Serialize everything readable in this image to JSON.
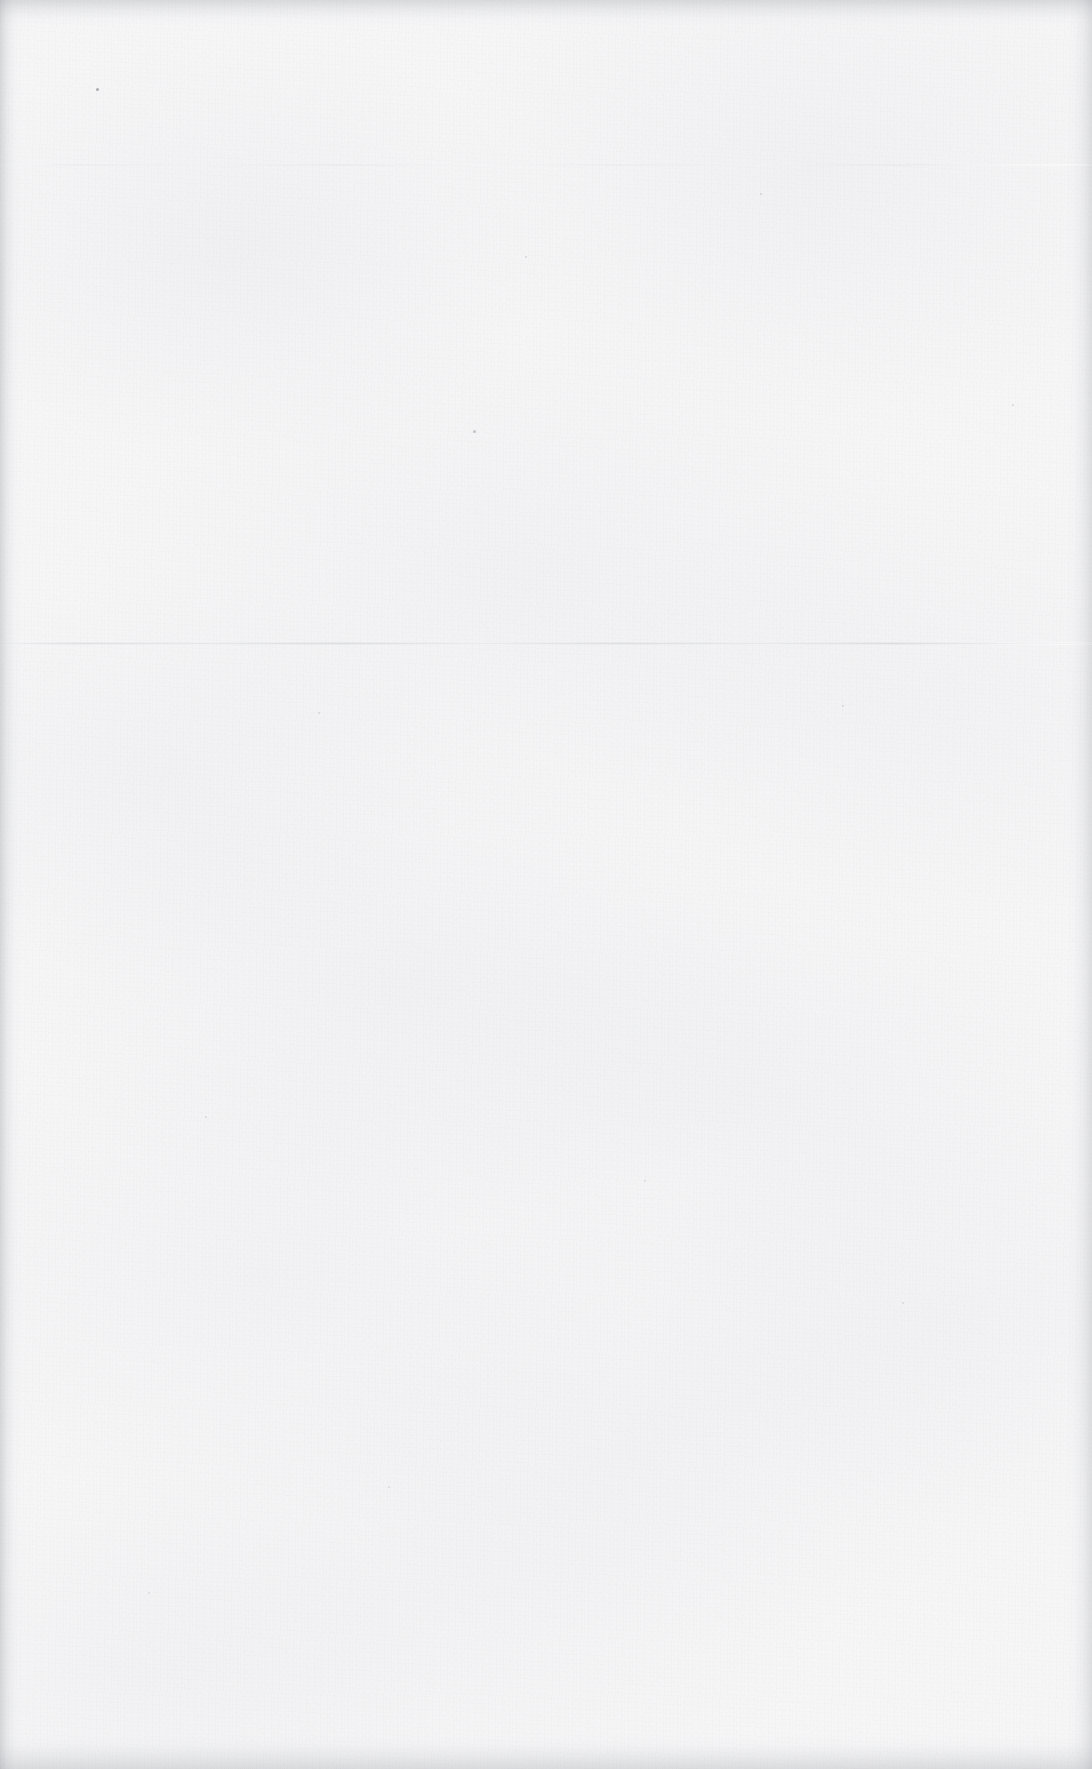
{
  "page": {
    "kind": "blank-scanned-page",
    "width": 1092,
    "height": 1769,
    "background_color": "#f6f6f7",
    "paper_tone_color": "#f7f7f8",
    "grain_color": "#a3a6ad",
    "has_text": false,
    "has_images": false,
    "has_tables": false
  },
  "artifacts": {
    "creases": [
      {
        "id": "primary-fold",
        "orientation": "horizontal",
        "y": 644,
        "thickness": 3,
        "color": "#babcc2",
        "opacity": 0.42
      },
      {
        "id": "secondary-fold",
        "orientation": "horizontal",
        "y": 165,
        "thickness": 2,
        "color": "#c4c6cb",
        "opacity": 0.26
      }
    ],
    "edge_shadows": [
      {
        "id": "top-edge-shadow",
        "side": "top",
        "extent": 26,
        "color": "#9698 9f"
      },
      {
        "id": "bottom-edge-shadow",
        "side": "bottom",
        "extent": 34,
        "color": "#96989f"
      },
      {
        "id": "left-edge-shadow",
        "side": "left",
        "extent": 22,
        "color": "#92949b"
      },
      {
        "id": "right-edge-shadow",
        "side": "right",
        "extent": 26,
        "color": "#96989f"
      }
    ],
    "specks": [
      {
        "x": 96,
        "y": 88,
        "size": 3,
        "color": "#8a8d94",
        "opacity": 0.7
      },
      {
        "x": 473,
        "y": 430,
        "size": 3,
        "color": "#9a9da4",
        "opacity": 0.55
      },
      {
        "x": 525,
        "y": 256,
        "size": 2,
        "color": "#a6a9b0",
        "opacity": 0.45
      },
      {
        "x": 760,
        "y": 193,
        "size": 2,
        "color": "#a6a9b0",
        "opacity": 0.42
      },
      {
        "x": 318,
        "y": 712,
        "size": 2,
        "color": "#a8abb2",
        "opacity": 0.4
      },
      {
        "x": 842,
        "y": 705,
        "size": 2,
        "color": "#a8abb2",
        "opacity": 0.38
      },
      {
        "x": 205,
        "y": 1116,
        "size": 2,
        "color": "#a8abb2",
        "opacity": 0.38
      },
      {
        "x": 644,
        "y": 1180,
        "size": 2,
        "color": "#aaadb4",
        "opacity": 0.35
      },
      {
        "x": 902,
        "y": 1302,
        "size": 2,
        "color": "#aaadb4",
        "opacity": 0.35
      },
      {
        "x": 388,
        "y": 1486,
        "size": 2,
        "color": "#aaadb4",
        "opacity": 0.33
      },
      {
        "x": 1012,
        "y": 404,
        "size": 2,
        "color": "#a4a7ae",
        "opacity": 0.4
      },
      {
        "x": 148,
        "y": 1592,
        "size": 2,
        "color": "#acafb6",
        "opacity": 0.32
      }
    ]
  },
  "content": {
    "body_text": ""
  }
}
